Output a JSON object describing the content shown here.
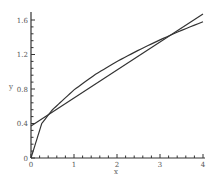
{
  "chart_data": {
    "type": "line",
    "title": "",
    "xlabel": "x",
    "ylabel": "y",
    "xlim": [
      0,
      4
    ],
    "ylim": [
      0,
      1.6
    ],
    "grid": false,
    "legend": null,
    "xticks": [
      "0",
      "1",
      "2",
      "3",
      "4"
    ],
    "yticks": [
      "0",
      "0.4",
      "0.8",
      "1.2",
      "1.6"
    ],
    "series": [
      {
        "name": "curve",
        "x": [
          0,
          0.25,
          0.5,
          1,
          1.5,
          2,
          2.5,
          3,
          3.5,
          4
        ],
        "y": [
          0,
          0.4,
          0.56,
          0.79,
          0.97,
          1.12,
          1.25,
          1.37,
          1.48,
          1.58
        ]
      },
      {
        "name": "linear approximation",
        "x": [
          0,
          4
        ],
        "y": [
          0.37,
          1.67
        ]
      }
    ],
    "colors": {
      "axis": "#333333",
      "curves": "#333333",
      "labels": "#555555"
    }
  }
}
